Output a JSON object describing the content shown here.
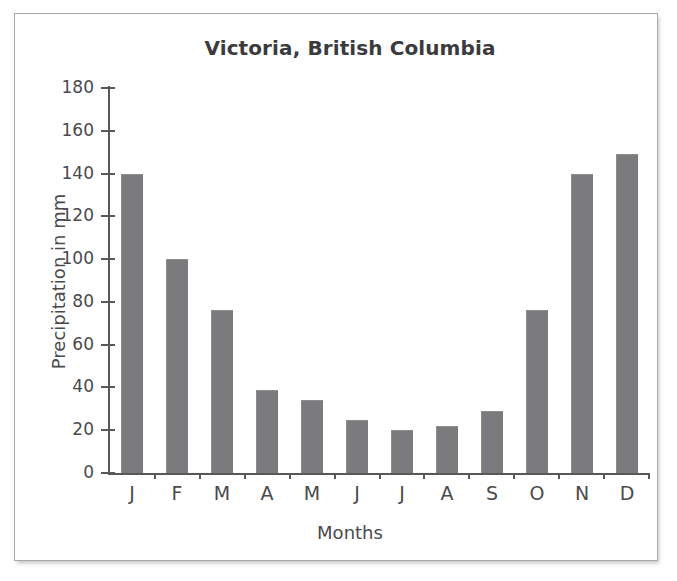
{
  "chart_data": {
    "type": "bar",
    "title": "Victoria, British Columbia",
    "xlabel": "Months",
    "ylabel": "Precipitation in mm",
    "categories": [
      "J",
      "F",
      "M",
      "A",
      "M",
      "J",
      "J",
      "A",
      "S",
      "O",
      "N",
      "D"
    ],
    "category_full_names": [
      "January",
      "February",
      "March",
      "April",
      "May",
      "June",
      "July",
      "August",
      "September",
      "October",
      "November",
      "December"
    ],
    "values": [
      140,
      100,
      76,
      39,
      34,
      25,
      20,
      22,
      29,
      76,
      140,
      149
    ],
    "unit": "mm",
    "ylim": [
      0,
      180
    ],
    "ytick_step": 20,
    "ytick_labels": [
      "180",
      "160",
      "140",
      "120",
      "100",
      "80",
      "60",
      "40",
      "20",
      "0"
    ],
    "ytick_values": [
      180,
      160,
      140,
      120,
      100,
      80,
      60,
      40,
      20,
      0
    ],
    "grid": false,
    "legend": false,
    "legend_position": "none",
    "bar_color": "#7b7b7d",
    "axis_color": "#58585a",
    "text_color": "#4a4a4c",
    "title_color": "#3b3b3d",
    "background": "#ffffff",
    "frame_color": "#a9a9ab"
  }
}
